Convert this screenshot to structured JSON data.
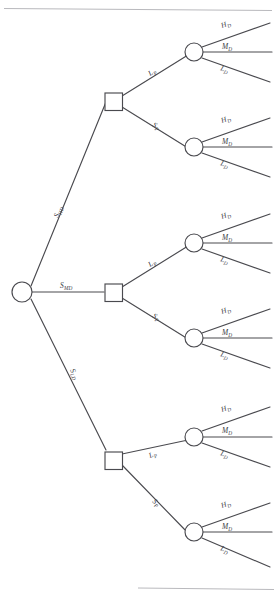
{
  "diagram": {
    "type": "decision-tree",
    "title": "",
    "root": {
      "node_name": "root-chance-node",
      "shape": "circle"
    },
    "level1_label_prefix": "S",
    "level2_label_prefix": "L",
    "level3_label_prefix": "H",
    "branches": [
      {
        "id": "branch-hd",
        "label_main": "S",
        "label_sub": "HD",
        "decision_node": "decision-node-hd",
        "sub_branches": [
          {
            "id": "sub-hd-lp",
            "label_main": "L",
            "label_sub": "P",
            "chance_node": "chance-node-hd-lp",
            "outcomes": [
              {
                "id": "outcome-hd-lp-h",
                "label_main": "H",
                "label_sub": "D"
              },
              {
                "id": "outcome-hd-lp-m",
                "label_main": "M",
                "label_sub": "D"
              },
              {
                "id": "outcome-hd-lp-l",
                "label_main": "L",
                "label_sub": "D"
              }
            ]
          },
          {
            "id": "sub-hd-sp",
            "label_main": "S",
            "label_sub": "P",
            "chance_node": "chance-node-hd-sp",
            "outcomes": [
              {
                "id": "outcome-hd-sp-h",
                "label_main": "H",
                "label_sub": "D"
              },
              {
                "id": "outcome-hd-sp-m",
                "label_main": "M",
                "label_sub": "D"
              },
              {
                "id": "outcome-hd-sp-l",
                "label_main": "L",
                "label_sub": "D"
              }
            ]
          }
        ]
      },
      {
        "id": "branch-md",
        "label_main": "S",
        "label_sub": "MD",
        "decision_node": "decision-node-md",
        "sub_branches": [
          {
            "id": "sub-md-lp",
            "label_main": "L",
            "label_sub": "P",
            "chance_node": "chance-node-md-lp",
            "outcomes": [
              {
                "id": "outcome-md-lp-h",
                "label_main": "H",
                "label_sub": "D"
              },
              {
                "id": "outcome-md-lp-m",
                "label_main": "M",
                "label_sub": "D"
              },
              {
                "id": "outcome-md-lp-l",
                "label_main": "L",
                "label_sub": "D"
              }
            ]
          },
          {
            "id": "sub-md-sp",
            "label_main": "S",
            "label_sub": "P",
            "chance_node": "chance-node-md-sp",
            "outcomes": [
              {
                "id": "outcome-md-sp-h",
                "label_main": "H",
                "label_sub": "D"
              },
              {
                "id": "outcome-md-sp-m",
                "label_main": "M",
                "label_sub": "D"
              },
              {
                "id": "outcome-md-sp-l",
                "label_main": "L",
                "label_sub": "D"
              }
            ]
          }
        ]
      },
      {
        "id": "branch-ld",
        "label_main": "S",
        "label_sub": "LD",
        "decision_node": "decision-node-ld",
        "sub_branches": [
          {
            "id": "sub-ld-lp",
            "label_main": "L",
            "label_sub": "P",
            "chance_node": "chance-node-ld-lp",
            "outcomes": [
              {
                "id": "outcome-ld-lp-h",
                "label_main": "H",
                "label_sub": "D"
              },
              {
                "id": "outcome-ld-lp-m",
                "label_main": "M",
                "label_sub": "D"
              },
              {
                "id": "outcome-ld-lp-l",
                "label_main": "L",
                "label_sub": "D"
              }
            ]
          },
          {
            "id": "sub-ld-sp",
            "label_main": "S",
            "label_sub": "P",
            "chance_node": "chance-node-ld-sp",
            "outcomes": [
              {
                "id": "outcome-ld-sp-h",
                "label_main": "H",
                "label_sub": "D"
              },
              {
                "id": "outcome-ld-sp-m",
                "label_main": "M",
                "label_sub": "D"
              },
              {
                "id": "outcome-ld-sp-l",
                "label_main": "L",
                "label_sub": "D"
              }
            ]
          }
        ]
      }
    ],
    "colors": {
      "line": "#4a4a4f",
      "rule": "#b9b9bd",
      "background": "#ffffff"
    }
  }
}
